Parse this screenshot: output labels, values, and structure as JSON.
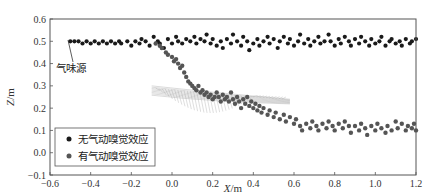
{
  "chart_data": {
    "type": "scatter",
    "title": "",
    "xlabel": "X/m",
    "ylabel": "Z/m",
    "xlim": [
      -0.6,
      1.2
    ],
    "ylim": [
      -0.1,
      0.6
    ],
    "xticks": [
      -0.6,
      -0.4,
      -0.2,
      0.0,
      0.2,
      0.4,
      0.6,
      0.8,
      1.0,
      1.2
    ],
    "xtick_labels": [
      "-0.6",
      "-0.4",
      "-0.2",
      "0.0",
      "0.2",
      "0.4",
      "0.6",
      "0.8",
      "1.0",
      "1.2"
    ],
    "yticks": [
      -0.1,
      0.0,
      0.1,
      0.2,
      0.3,
      0.4,
      0.5,
      0.6
    ],
    "ytick_labels": [
      "-0.1",
      "0.0",
      "0.1",
      "0.2",
      "0.3",
      "0.4",
      "0.5",
      "0.6"
    ],
    "grid": false,
    "legend_position": "lower left",
    "legend": [
      "无气动嗅觉效应",
      "有气动嗅觉效应"
    ],
    "annotations": [
      {
        "text": "气味源",
        "point": [
          -0.52,
          0.5
        ],
        "text_pos": [
          -0.58,
          0.43
        ]
      }
    ],
    "series": [
      {
        "name": "无气动嗅觉效应",
        "color": "#1a1a1a",
        "points": [
          [
            -0.5,
            0.5
          ],
          [
            -0.48,
            0.5
          ],
          [
            -0.46,
            0.5
          ],
          [
            -0.44,
            0.49
          ],
          [
            -0.42,
            0.5
          ],
          [
            -0.4,
            0.49
          ],
          [
            -0.38,
            0.5
          ],
          [
            -0.36,
            0.49
          ],
          [
            -0.34,
            0.5
          ],
          [
            -0.32,
            0.49
          ],
          [
            -0.3,
            0.5
          ],
          [
            -0.28,
            0.49
          ],
          [
            -0.26,
            0.5
          ],
          [
            -0.25,
            0.49
          ],
          [
            -0.22,
            0.5
          ],
          [
            -0.2,
            0.48
          ],
          [
            -0.18,
            0.5
          ],
          [
            -0.16,
            0.49
          ],
          [
            -0.15,
            0.51
          ],
          [
            -0.13,
            0.5
          ],
          [
            -0.11,
            0.48
          ],
          [
            -0.09,
            0.52
          ],
          [
            -0.07,
            0.5
          ],
          [
            -0.06,
            0.49
          ],
          [
            -0.04,
            0.47
          ],
          [
            -0.02,
            0.51
          ],
          [
            0.0,
            0.49
          ],
          [
            0.02,
            0.52
          ],
          [
            0.03,
            0.5
          ],
          [
            0.05,
            0.49
          ],
          [
            0.07,
            0.51
          ],
          [
            0.09,
            0.5
          ],
          [
            0.11,
            0.52
          ],
          [
            0.12,
            0.49
          ],
          [
            0.14,
            0.51
          ],
          [
            0.16,
            0.5
          ],
          [
            0.17,
            0.53
          ],
          [
            0.19,
            0.49
          ],
          [
            0.2,
            0.51
          ],
          [
            0.22,
            0.48
          ],
          [
            0.24,
            0.5
          ],
          [
            0.25,
            0.47
          ],
          [
            0.27,
            0.51
          ],
          [
            0.29,
            0.49
          ],
          [
            0.3,
            0.53
          ],
          [
            0.32,
            0.5
          ],
          [
            0.34,
            0.48
          ],
          [
            0.35,
            0.52
          ],
          [
            0.37,
            0.5
          ],
          [
            0.38,
            0.46
          ],
          [
            0.4,
            0.49
          ],
          [
            0.42,
            0.51
          ],
          [
            0.43,
            0.48
          ],
          [
            0.45,
            0.5
          ],
          [
            0.47,
            0.52
          ],
          [
            0.48,
            0.49
          ],
          [
            0.5,
            0.51
          ],
          [
            0.52,
            0.47
          ],
          [
            0.53,
            0.5
          ],
          [
            0.55,
            0.52
          ],
          [
            0.57,
            0.49
          ],
          [
            0.58,
            0.51
          ],
          [
            0.6,
            0.48
          ],
          [
            0.62,
            0.5
          ],
          [
            0.63,
            0.53
          ],
          [
            0.65,
            0.49
          ],
          [
            0.67,
            0.51
          ],
          [
            0.68,
            0.48
          ],
          [
            0.7,
            0.5
          ],
          [
            0.72,
            0.52
          ],
          [
            0.73,
            0.49
          ],
          [
            0.75,
            0.5
          ],
          [
            0.77,
            0.53
          ],
          [
            0.78,
            0.5
          ],
          [
            0.8,
            0.48
          ],
          [
            0.82,
            0.51
          ],
          [
            0.83,
            0.49
          ],
          [
            0.85,
            0.52
          ],
          [
            0.87,
            0.5
          ],
          [
            0.88,
            0.48
          ],
          [
            0.9,
            0.51
          ],
          [
            0.92,
            0.49
          ],
          [
            0.93,
            0.52
          ],
          [
            0.95,
            0.5
          ],
          [
            0.97,
            0.48
          ],
          [
            0.98,
            0.51
          ],
          [
            1.0,
            0.49
          ],
          [
            1.02,
            0.5
          ],
          [
            1.03,
            0.52
          ],
          [
            1.05,
            0.48
          ],
          [
            1.07,
            0.5
          ],
          [
            1.08,
            0.51
          ],
          [
            1.1,
            0.49
          ],
          [
            1.12,
            0.5
          ],
          [
            1.13,
            0.48
          ],
          [
            1.15,
            0.51
          ],
          [
            1.17,
            0.49
          ],
          [
            1.18,
            0.5
          ],
          [
            1.2,
            0.51
          ]
        ]
      },
      {
        "name": "有气动嗅觉效应",
        "color": "#555555",
        "points": [
          [
            -0.08,
            0.49
          ],
          [
            -0.06,
            0.48
          ],
          [
            -0.05,
            0.47
          ],
          [
            -0.03,
            0.45
          ],
          [
            -0.02,
            0.44
          ],
          [
            0.0,
            0.43
          ],
          [
            0.01,
            0.41
          ],
          [
            0.02,
            0.42
          ],
          [
            0.03,
            0.4
          ],
          [
            0.04,
            0.38
          ],
          [
            0.05,
            0.39
          ],
          [
            0.06,
            0.36
          ],
          [
            0.07,
            0.34
          ],
          [
            0.08,
            0.32
          ],
          [
            0.09,
            0.31
          ],
          [
            0.1,
            0.3
          ],
          [
            0.11,
            0.29
          ],
          [
            0.12,
            0.28
          ],
          [
            0.13,
            0.3
          ],
          [
            0.14,
            0.27
          ],
          [
            0.15,
            0.28
          ],
          [
            0.16,
            0.26
          ],
          [
            0.17,
            0.27
          ],
          [
            0.18,
            0.25
          ],
          [
            0.19,
            0.26
          ],
          [
            0.2,
            0.24
          ],
          [
            0.21,
            0.25
          ],
          [
            0.22,
            0.27
          ],
          [
            0.23,
            0.25
          ],
          [
            0.24,
            0.23
          ],
          [
            0.25,
            0.26
          ],
          [
            0.26,
            0.24
          ],
          [
            0.27,
            0.25
          ],
          [
            0.28,
            0.23
          ],
          [
            0.29,
            0.27
          ],
          [
            0.3,
            0.24
          ],
          [
            0.31,
            0.22
          ],
          [
            0.32,
            0.25
          ],
          [
            0.33,
            0.23
          ],
          [
            0.34,
            0.2
          ],
          [
            0.35,
            0.24
          ],
          [
            0.36,
            0.22
          ],
          [
            0.37,
            0.25
          ],
          [
            0.38,
            0.21
          ],
          [
            0.39,
            0.23
          ],
          [
            0.4,
            0.2
          ],
          [
            0.41,
            0.22
          ],
          [
            0.42,
            0.19
          ],
          [
            0.43,
            0.21
          ],
          [
            0.44,
            0.18
          ],
          [
            0.45,
            0.2
          ],
          [
            0.47,
            0.17
          ],
          [
            0.48,
            0.19
          ],
          [
            0.5,
            0.16
          ],
          [
            0.51,
            0.18
          ],
          [
            0.53,
            0.15
          ],
          [
            0.55,
            0.17
          ],
          [
            0.56,
            0.14
          ],
          [
            0.58,
            0.16
          ],
          [
            0.6,
            0.13
          ],
          [
            0.61,
            0.15
          ],
          [
            0.63,
            0.12
          ],
          [
            0.64,
            0.1
          ],
          [
            0.66,
            0.13
          ],
          [
            0.68,
            0.11
          ],
          [
            0.69,
            0.14
          ],
          [
            0.71,
            0.12
          ],
          [
            0.72,
            0.1
          ],
          [
            0.74,
            0.13
          ],
          [
            0.76,
            0.11
          ],
          [
            0.77,
            0.14
          ],
          [
            0.79,
            0.12
          ],
          [
            0.8,
            0.1
          ],
          [
            0.82,
            0.13
          ],
          [
            0.84,
            0.11
          ],
          [
            0.85,
            0.14
          ],
          [
            0.87,
            0.12
          ],
          [
            0.88,
            0.09
          ],
          [
            0.9,
            0.12
          ],
          [
            0.92,
            0.1
          ],
          [
            0.93,
            0.13
          ],
          [
            0.95,
            0.11
          ],
          [
            0.96,
            0.08
          ],
          [
            0.98,
            0.12
          ],
          [
            1.0,
            0.1
          ],
          [
            1.01,
            0.13
          ],
          [
            1.03,
            0.11
          ],
          [
            1.05,
            0.09
          ],
          [
            1.06,
            0.12
          ],
          [
            1.08,
            0.1
          ],
          [
            1.1,
            0.14
          ],
          [
            1.11,
            0.11
          ],
          [
            1.13,
            0.13
          ],
          [
            1.15,
            0.1
          ],
          [
            1.16,
            0.12
          ],
          [
            1.18,
            0.11
          ],
          [
            1.19,
            0.13
          ],
          [
            1.2,
            0.1
          ]
        ]
      }
    ],
    "overlay": {
      "description": "gray wing-like body drawn with thin lines near (0.1 to 0.6, 0.2 to 0.3)",
      "color": "#999999"
    }
  }
}
